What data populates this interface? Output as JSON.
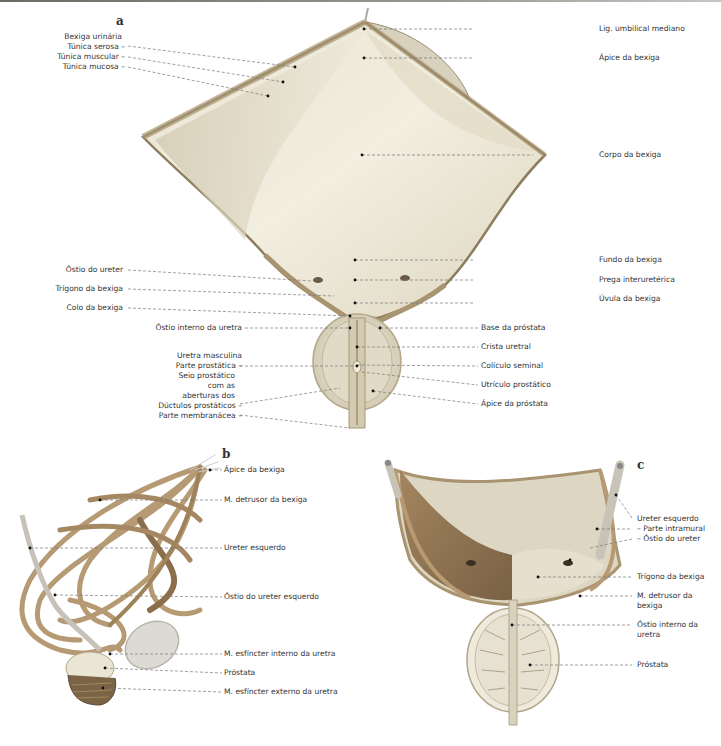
{
  "panels": {
    "a": {
      "letter": "a",
      "left_labels": {
        "bexiga_urinaria": "Bexiga urinária",
        "tunica_serosa": "Túnica serosa –",
        "tunica_muscular": "Túnica muscular –",
        "tunica_mucosa": "Túnica mucosa –",
        "ostio_ureter": "Óstio do ureter",
        "trigono": "Trígono da bexiga",
        "colo": "Colo da bexiga",
        "ostio_interno": "Óstio interno da uretra",
        "uretra_masculina": "Uretra masculina",
        "parte_prostatica": "Parte prostática –",
        "seio_1": "Seio prostático",
        "seio_2": "com as",
        "seio_3": "aberturas dos",
        "ductulos": "Dúctulos prostáticos –",
        "parte_membranacea": "Parte membranácea –"
      },
      "right_labels": {
        "lig_umbilical": "Lig. umbilical mediano",
        "apice": "Ápice da bexiga",
        "corpo": "Corpo da bexiga",
        "fundo": "Fundo da bexiga",
        "prega": "Prega interuretérica",
        "uvula": "Úvula da bexiga",
        "base_prostata": "Base da próstata",
        "crista": "Crista uretral",
        "coliculo": "Colículo seminal",
        "utriculo": "Utrículo prostático",
        "apice_prostata": "Ápice da próstata"
      }
    },
    "b": {
      "letter": "b",
      "labels": {
        "apice": "Ápice da bexiga",
        "detrusor": "M. detrusor da bexiga",
        "ureter": "Ureter esquerdo",
        "ostio_ureter": "Óstio do ureter esquerdo",
        "esfincter_interno": "M. esfíncter interno da uretra",
        "prostata": "Próstata",
        "esfincter_externo": "M. esfíncter externo da uretra"
      }
    },
    "c": {
      "letter": "c",
      "labels": {
        "ureter": "Ureter esquerdo",
        "intramural": "– Parte intramural",
        "ostio_ureter": "– Óstio do ureter",
        "trigono": "Trígono da bexiga",
        "detrusor_1": "M. detrusor da",
        "detrusor_2": "bexiga",
        "ostio_interno_1": "Óstio interno da",
        "ostio_interno_2": "uretra",
        "prostata": "Próstata"
      }
    }
  },
  "colors": {
    "bladder_fill": "#ece6d4",
    "bladder_shade": "#d9d1bc",
    "wall": "#a89470",
    "muscle": "#b89a72",
    "muscle_dark": "#7d6546",
    "leader": "#7a7a7a",
    "text": "#333333"
  }
}
